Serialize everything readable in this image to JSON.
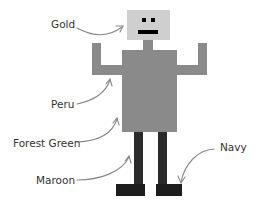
{
  "diagram": {
    "colors": {
      "head": "#cfcfcf",
      "neck_body_arms": "#8a8a8a",
      "legs": "#2b2b2b",
      "feet": "#1e1e1e",
      "face": "#000000",
      "arrow": "#888888",
      "text": "#333333"
    },
    "labels": [
      {
        "id": "gold",
        "text": "Gold",
        "target": "head"
      },
      {
        "id": "peru",
        "text": "Peru",
        "target": "left-arm"
      },
      {
        "id": "forest-green",
        "text": "Forest Green",
        "target": "body"
      },
      {
        "id": "maroon",
        "text": "Maroon",
        "target": "left-leg"
      },
      {
        "id": "navy",
        "text": "Navy",
        "target": "right-foot"
      }
    ]
  }
}
